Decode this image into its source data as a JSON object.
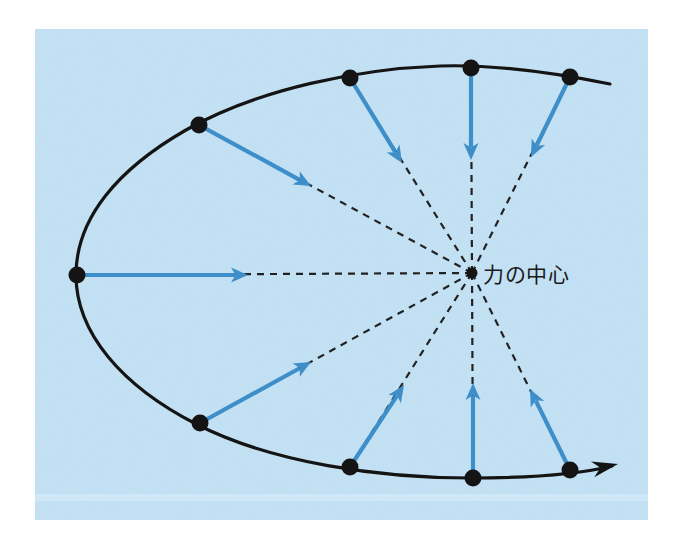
{
  "figure": {
    "panel": {
      "x": 35,
      "y": 29,
      "width": 613,
      "height": 491,
      "fill": "#c3e2f5"
    },
    "page_background": "#ffffff",
    "colors": {
      "panel_blue": "#c3e2f5",
      "vector_blue": "#3d8ec9",
      "curve_black": "#141414",
      "dashed_gray": "#222222",
      "label_text": "#1a1a1a"
    },
    "center_of_force": {
      "label": "力の中心",
      "label_x": 483,
      "label_y": 282,
      "x": 472,
      "y": 273,
      "dot_radius": 5.5
    },
    "trajectory": {
      "type": "open-hyperbolic-orbit",
      "stroke": "#141414",
      "path": "M 610 84 C 560 74 500 64 440 66 C 360 69 260 88 186 130 C 118 169 76 218 76 275 C 76 333 122 386 196 424 C 272 463 380 478 470 478 C 530 478 580 474 612 466",
      "arrow_tip": {
        "x": 618,
        "y": 464
      },
      "arrow_angle_deg": -12
    },
    "orbit_points": [
      {
        "id": "p1",
        "x": 570,
        "y": 77,
        "label": "point-upper-right"
      },
      {
        "id": "p2",
        "x": 471,
        "y": 68,
        "label": "point-top-right"
      },
      {
        "id": "p3",
        "x": 350,
        "y": 78,
        "label": "point-top-left"
      },
      {
        "id": "p4",
        "x": 199,
        "y": 125,
        "label": "point-upper-left"
      },
      {
        "id": "p5",
        "x": 77,
        "y": 275,
        "label": "point-leftmost-apsis"
      },
      {
        "id": "p6",
        "x": 200,
        "y": 423,
        "label": "point-lower-left"
      },
      {
        "id": "p7",
        "x": 350,
        "y": 467,
        "label": "point-bottom-left"
      },
      {
        "id": "p8",
        "x": 473,
        "y": 478,
        "label": "point-bottom-right"
      },
      {
        "id": "p9",
        "x": 570,
        "y": 470,
        "label": "point-lower-right"
      }
    ],
    "force_vectors": [
      {
        "id": "v1",
        "from_x": 570,
        "from_y": 77,
        "to_x": 531,
        "to_y": 157,
        "points_to": "center"
      },
      {
        "id": "v2",
        "from_x": 471,
        "from_y": 68,
        "to_x": 471,
        "to_y": 160,
        "points_to": "center"
      },
      {
        "id": "v3",
        "from_x": 350,
        "from_y": 78,
        "to_x": 402,
        "to_y": 163,
        "points_to": "center"
      },
      {
        "id": "v4",
        "from_x": 199,
        "from_y": 125,
        "to_x": 311,
        "to_y": 186,
        "points_to": "center"
      },
      {
        "id": "v5",
        "from_x": 77,
        "from_y": 275,
        "to_x": 248,
        "to_y": 275,
        "points_to": "center"
      },
      {
        "id": "v6",
        "from_x": 200,
        "from_y": 423,
        "to_x": 311,
        "to_y": 362,
        "points_to": "center"
      },
      {
        "id": "v7",
        "from_x": 350,
        "from_y": 467,
        "to_x": 404,
        "to_y": 385,
        "points_to": "center"
      },
      {
        "id": "v8",
        "from_x": 473,
        "from_y": 478,
        "to_x": 473,
        "to_y": 383,
        "points_to": "center"
      },
      {
        "id": "v9",
        "from_x": 570,
        "from_y": 470,
        "to_x": 530,
        "to_y": 389,
        "points_to": "center"
      }
    ],
    "radial_lines": [
      {
        "id": "r1",
        "x1": 472,
        "y1": 273,
        "x2": 570,
        "y2": 77
      },
      {
        "id": "r2",
        "x1": 472,
        "y1": 273,
        "x2": 471,
        "y2": 68
      },
      {
        "id": "r3",
        "x1": 472,
        "y1": 273,
        "x2": 350,
        "y2": 78
      },
      {
        "id": "r4",
        "x1": 472,
        "y1": 273,
        "x2": 199,
        "y2": 125
      },
      {
        "id": "r5",
        "x1": 472,
        "y1": 273,
        "x2": 77,
        "y2": 275
      },
      {
        "id": "r6",
        "x1": 472,
        "y1": 273,
        "x2": 200,
        "y2": 423
      },
      {
        "id": "r7",
        "x1": 472,
        "y1": 273,
        "x2": 350,
        "y2": 467
      },
      {
        "id": "r8",
        "x1": 472,
        "y1": 273,
        "x2": 473,
        "y2": 478
      },
      {
        "id": "r9",
        "x1": 472,
        "y1": 273,
        "x2": 570,
        "y2": 470
      }
    ]
  }
}
